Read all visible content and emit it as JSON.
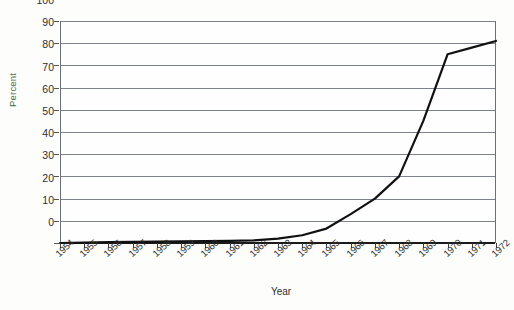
{
  "chart_data": {
    "type": "line",
    "title": "",
    "xlabel": "Year",
    "ylabel": "Percent",
    "xlim": [
      1954,
      1972
    ],
    "ylim": [
      0,
      100
    ],
    "y_ticks": [
      0,
      10,
      20,
      30,
      40,
      50,
      60,
      70,
      80,
      90,
      100
    ],
    "grid": true,
    "legend": "none",
    "line_color": "#111111",
    "grid_color": "#7d818a",
    "categories": [
      "1954",
      "1955",
      "1956",
      "1957",
      "1958",
      "1959",
      "1960",
      "1961",
      "1962",
      "1963",
      "1964",
      "1965",
      "1966",
      "1967",
      "1968",
      "1969",
      "1970",
      "1971",
      "1972"
    ],
    "series": [
      {
        "name": "Percent",
        "values": [
          0,
          0.2,
          0.4,
          0.5,
          0.6,
          0.7,
          0.8,
          1,
          1.2,
          2,
          3.5,
          6.5,
          13,
          20,
          30,
          55,
          85,
          88,
          91
        ]
      }
    ]
  },
  "axis": {
    "y_title": "Percent",
    "x_title": "Year"
  }
}
